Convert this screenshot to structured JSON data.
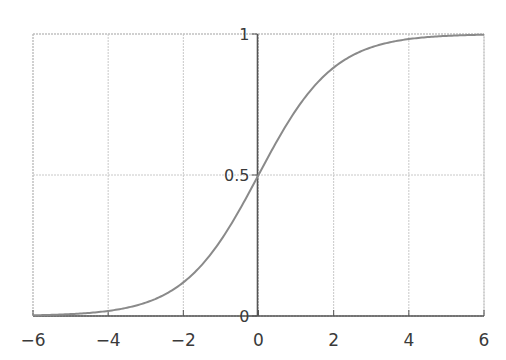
{
  "chart_data": {
    "type": "line",
    "title": "",
    "xlabel": "",
    "ylabel": "",
    "function": "1/(1+exp(-x))",
    "xlim": [
      -6,
      6
    ],
    "ylim": [
      0,
      1
    ],
    "grid": true,
    "x_ticks": [
      -6,
      -4,
      -2,
      0,
      2,
      4,
      6
    ],
    "x_tick_labels": [
      "−6",
      "−4",
      "−2",
      "0",
      "2",
      "4",
      "6"
    ],
    "y_ticks": [
      0,
      0.5,
      1
    ],
    "y_tick_labels": [
      "0",
      "0.5",
      "1"
    ],
    "series": [
      {
        "name": "sigmoid",
        "color": "#8a8a8a",
        "x": [
          -6,
          -5,
          -4,
          -3,
          -2,
          -1,
          0,
          1,
          2,
          3,
          4,
          5,
          6
        ],
        "values": [
          0.0025,
          0.0067,
          0.018,
          0.047,
          0.119,
          0.269,
          0.5,
          0.731,
          0.881,
          0.953,
          0.982,
          0.9933,
          0.9975
        ]
      }
    ]
  }
}
